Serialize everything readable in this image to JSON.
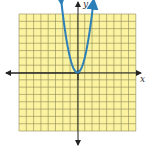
{
  "graph": {
    "title": "",
    "x_axis_label": "x",
    "y_axis_label": "y",
    "grid": {
      "xmin": -8,
      "xmax": 8,
      "ymin": -8,
      "ymax": 8,
      "step": 1
    },
    "colors": {
      "grid_fill": "#fbf3a0",
      "grid_line": "#8d8a55",
      "axis": "#222222",
      "curve": "#2d7fb8"
    }
  },
  "chart_data": {
    "type": "line",
    "title": "",
    "xlabel": "x",
    "ylabel": "y",
    "xlim": [
      -8,
      8
    ],
    "ylim": [
      -8,
      8
    ],
    "grid": true,
    "series": [
      {
        "name": "y = 2x^2",
        "x": [
          -2,
          -1.5,
          -1,
          -0.5,
          0,
          0.5,
          1,
          1.5,
          2
        ],
        "values": [
          8,
          4.5,
          2,
          0.5,
          0,
          0.5,
          2,
          4.5,
          8
        ]
      }
    ]
  }
}
